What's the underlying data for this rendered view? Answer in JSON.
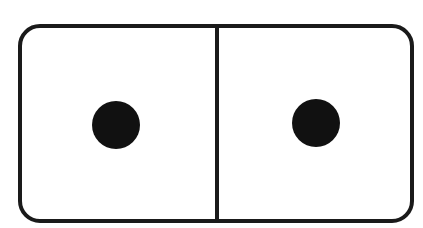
{
  "domino": {
    "left_value": 1,
    "right_value": 1,
    "label": "Domino tile 1-1",
    "colors": {
      "ink": "#1a1a1a",
      "pip": "#111111",
      "face": "#ffffff"
    }
  }
}
